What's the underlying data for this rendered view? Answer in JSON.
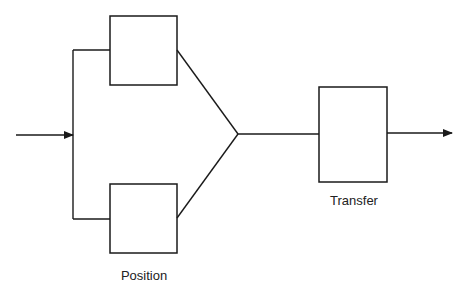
{
  "diagram": {
    "type": "block-diagram",
    "nodes": [
      {
        "id": "position-top",
        "kind": "box"
      },
      {
        "id": "position-bottom",
        "kind": "box"
      },
      {
        "id": "junction",
        "kind": "merge-point"
      },
      {
        "id": "transfer",
        "kind": "box"
      }
    ],
    "edges": [
      {
        "from": "input",
        "to": "split",
        "arrow": true
      },
      {
        "from": "split",
        "to": "position-top"
      },
      {
        "from": "split",
        "to": "position-bottom"
      },
      {
        "from": "position-top",
        "to": "junction"
      },
      {
        "from": "position-bottom",
        "to": "junction"
      },
      {
        "from": "junction",
        "to": "transfer"
      },
      {
        "from": "transfer",
        "to": "output",
        "arrow": true
      }
    ],
    "labels": {
      "position": "Position",
      "transfer": "Transfer"
    },
    "colors": {
      "stroke": "#1a1a1a",
      "background": "#ffffff"
    }
  }
}
